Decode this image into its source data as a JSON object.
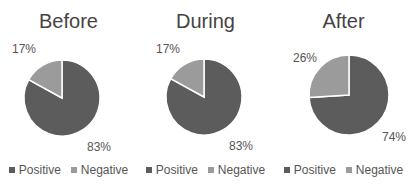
{
  "colors": {
    "positive": "#5c5c5c",
    "negative": "#9b9b9b",
    "separator": "#ffffff"
  },
  "legend": {
    "positive": "Positive",
    "negative": "Negative"
  },
  "charts": [
    {
      "title": "Before",
      "positive_label": "83%",
      "negative_label": "17%"
    },
    {
      "title": "During",
      "positive_label": "83%",
      "negative_label": "17%"
    },
    {
      "title": "After",
      "positive_label": "74%",
      "negative_label": "26%"
    }
  ],
  "chart_data": [
    {
      "type": "pie",
      "title": "Before",
      "categories": [
        "Positive",
        "Negative"
      ],
      "values": [
        83,
        17
      ],
      "legend_position": "bottom"
    },
    {
      "type": "pie",
      "title": "During",
      "categories": [
        "Positive",
        "Negative"
      ],
      "values": [
        83,
        17
      ],
      "legend_position": "bottom"
    },
    {
      "type": "pie",
      "title": "After",
      "categories": [
        "Positive",
        "Negative"
      ],
      "values": [
        74,
        26
      ],
      "legend_position": "bottom"
    }
  ]
}
